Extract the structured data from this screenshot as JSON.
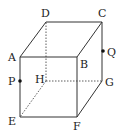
{
  "diagram": {
    "type": "cube",
    "vertices": {
      "A": {
        "label": "A",
        "x": 20,
        "y": 57,
        "lx": 8,
        "ly": 61
      },
      "B": {
        "label": "B",
        "x": 77,
        "y": 57,
        "lx": 80,
        "ly": 68
      },
      "C": {
        "label": "C",
        "x": 102,
        "y": 22,
        "lx": 98,
        "ly": 17
      },
      "D": {
        "label": "D",
        "x": 46,
        "y": 22,
        "lx": 41,
        "ly": 17
      },
      "E": {
        "label": "E",
        "x": 20,
        "y": 117,
        "lx": 8,
        "ly": 125
      },
      "F": {
        "label": "F",
        "x": 77,
        "y": 117,
        "lx": 73,
        "ly": 130
      },
      "G": {
        "label": "G",
        "x": 102,
        "y": 81,
        "lx": 105,
        "ly": 86
      },
      "H": {
        "label": "H",
        "x": 46,
        "y": 81,
        "lx": 35,
        "ly": 83
      }
    },
    "points": {
      "P": {
        "label": "P",
        "x": 20,
        "y": 81,
        "lx": 8,
        "ly": 85
      },
      "Q": {
        "label": "Q",
        "x": 103,
        "y": 51,
        "lx": 107,
        "ly": 56
      }
    },
    "solid_edges": [
      "AB",
      "BC",
      "CD",
      "DA",
      "AE",
      "EF",
      "FB",
      "FG",
      "GC"
    ],
    "dashed_edges": [
      "HD",
      "HE",
      "HG"
    ],
    "stroke_color": "#333333"
  }
}
